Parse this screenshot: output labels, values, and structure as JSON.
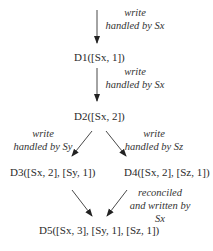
{
  "diagram": {
    "type": "version-vector-evolution",
    "colors": {
      "text": "#2a2a2a",
      "arrow": "#222222",
      "background": "#ffffff"
    },
    "nodes": [
      {
        "id": "D1",
        "label": "D1([Sx, 1])"
      },
      {
        "id": "D2",
        "label": "D2([Sx, 2])"
      },
      {
        "id": "D3",
        "label": "D3([Sx, 2], [Sy, 1])"
      },
      {
        "id": "D4",
        "label": "D4([Sx, 2], [Sz, 1])"
      },
      {
        "id": "D5",
        "label": "D5([Sx, 3], [Sy, 1], [Sz, 1])"
      }
    ],
    "edges": [
      {
        "from": null,
        "to": "D1",
        "label_lines": [
          "write",
          "handled by Sx"
        ]
      },
      {
        "from": "D1",
        "to": "D2",
        "label_lines": [
          "write",
          "handled by Sx"
        ]
      },
      {
        "from": "D2",
        "to": "D3",
        "label_lines": [
          "write",
          "handled by Sy"
        ]
      },
      {
        "from": "D2",
        "to": "D4",
        "label_lines": [
          "write",
          "handled by Sz"
        ]
      },
      {
        "from": "D3",
        "to": "D5",
        "label_lines": []
      },
      {
        "from": "D4",
        "to": "D5",
        "label_lines": [
          "reconciled",
          "and written by",
          "Sx"
        ]
      }
    ]
  }
}
